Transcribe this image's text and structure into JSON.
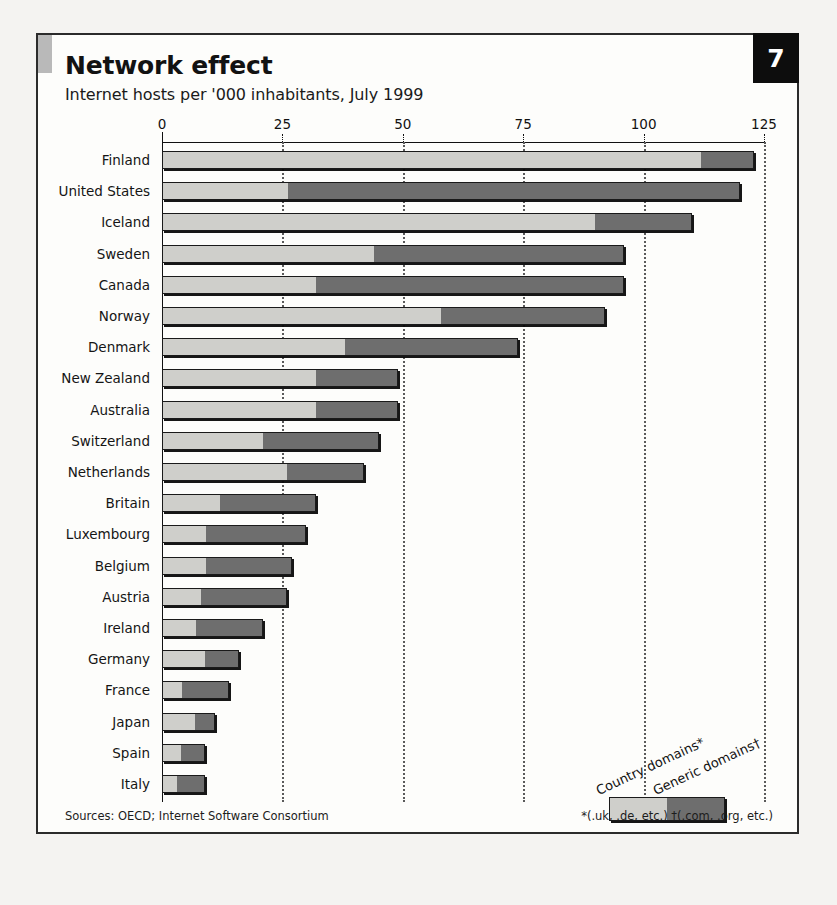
{
  "panel": {
    "number": "7",
    "title": "Network effect",
    "subtitle": "Internet hosts per '000 inhabitants, July 1999",
    "source": "Sources: OECD; Internet Software Consortium",
    "footnote": "*(.uk, .de, etc.)  †(.com, .org, etc.)"
  },
  "legend": {
    "country_label": "Country domains*",
    "generic_label": "Generic domains†"
  },
  "colors": {
    "country_domains": "#cfcfcb",
    "generic_domains": "#6e6e6e",
    "outline": "#1a1a1a",
    "panel_background": "#fdfdfb",
    "number_box": "#0d0d0d",
    "corner_tab": "#b9b9b9"
  },
  "chart_data": {
    "type": "bar",
    "orientation": "horizontal",
    "stacked": true,
    "title": "Network effect",
    "subtitle": "Internet hosts per '000 inhabitants, July 1999",
    "xlabel": "Internet hosts per '000 inhabitants",
    "ylabel": "",
    "xlim": [
      0,
      125
    ],
    "xticks": [
      0,
      25,
      50,
      75,
      100,
      125
    ],
    "xtick_labels": [
      "0",
      "25",
      "50",
      "75",
      "100",
      "125"
    ],
    "grid": "vertical-dotted",
    "legend_position": "bottom-right",
    "categories": [
      "Finland",
      "United States",
      "Iceland",
      "Sweden",
      "Canada",
      "Norway",
      "Denmark",
      "New Zealand",
      "Australia",
      "Switzerland",
      "Netherlands",
      "Britain",
      "Luxembourg",
      "Belgium",
      "Austria",
      "Ireland",
      "Germany",
      "France",
      "Japan",
      "Spain",
      "Italy"
    ],
    "series": [
      {
        "name": "Country domains*",
        "color": "#cfcfcb",
        "values": [
          112,
          26,
          90,
          44,
          32,
          58,
          38,
          32,
          32,
          21,
          26,
          12,
          9,
          9,
          8,
          7,
          9,
          4,
          7,
          4,
          3
        ]
      },
      {
        "name": "Generic domains†",
        "color": "#6e6e6e",
        "values": [
          11,
          94,
          20,
          52,
          64,
          34,
          36,
          17,
          17,
          24,
          16,
          20,
          21,
          18,
          18,
          14,
          7,
          10,
          4,
          5,
          6
        ]
      }
    ],
    "totals": [
      123,
      120,
      110,
      96,
      96,
      92,
      74,
      49,
      49,
      45,
      42,
      32,
      30,
      27,
      26,
      21,
      16,
      14,
      11,
      9,
      9
    ]
  }
}
